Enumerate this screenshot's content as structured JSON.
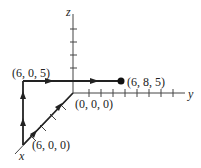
{
  "diagram": {
    "type": "3d-coordinate-path",
    "axes": {
      "x": "x",
      "y": "y",
      "z": "z"
    },
    "points": {
      "origin": "(0, 0, 0)",
      "p1": "(6, 0, 0)",
      "p2": "(6, 0, 5)",
      "p3": "(6, 8, 5)"
    },
    "path": [
      "(0, 0, 0)",
      "(6, 0, 0)",
      "(6, 0, 5)",
      "(6, 8, 5)"
    ],
    "colors": {
      "line": "#333333",
      "background": "#ffffff"
    }
  }
}
